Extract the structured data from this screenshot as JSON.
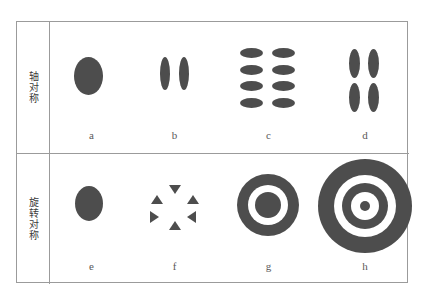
{
  "figure": {
    "title_present": false,
    "rows": [
      {
        "id": "axial",
        "category_label": "轴对称",
        "cells": [
          {
            "id": "a",
            "label": "a",
            "shape": "single-ellipse"
          },
          {
            "id": "b",
            "label": "b",
            "shape": "two-vertical-ellipses"
          },
          {
            "id": "c",
            "label": "c",
            "shape": "grid-4x2-horizontal-ellipses"
          },
          {
            "id": "d",
            "label": "d",
            "shape": "grid-2x2-vertical-ellipses"
          }
        ]
      },
      {
        "id": "rotational",
        "category_label": "旋转对称",
        "cells": [
          {
            "id": "e",
            "label": "e",
            "shape": "single-circle"
          },
          {
            "id": "f",
            "label": "f",
            "shape": "six-triangles-radial"
          },
          {
            "id": "g",
            "label": "g",
            "shape": "concentric-rings-2"
          },
          {
            "id": "h",
            "label": "h",
            "shape": "concentric-rings-4"
          }
        ]
      }
    ],
    "colors": {
      "shape_fill": "#4d4d4d",
      "border": "#9b9b9b",
      "background": "#ffffff",
      "label_text": "#595959",
      "category_text": "#3a3a3a"
    }
  }
}
